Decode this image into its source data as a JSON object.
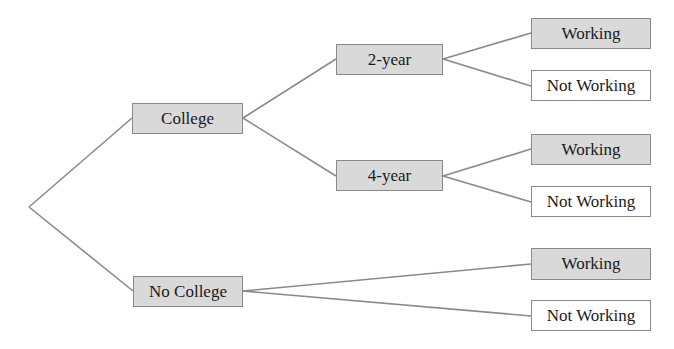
{
  "diagram": {
    "type": "tree",
    "colors": {
      "shaded_fill": "#d9d9d9",
      "plain_fill": "#ffffff",
      "edge": "#8a8a8a",
      "border": "#8a8a8a"
    },
    "root": {
      "x": 29,
      "y": 207
    },
    "level1": [
      {
        "label": "College",
        "fill": "shaded"
      },
      {
        "label": "No College",
        "fill": "shaded"
      }
    ],
    "level2": [
      {
        "label": "2-year",
        "parent": "College",
        "fill": "shaded"
      },
      {
        "label": "4-year",
        "parent": "College",
        "fill": "shaded"
      }
    ],
    "leaves": [
      {
        "label": "Working",
        "parent": "2-year",
        "fill": "shaded"
      },
      {
        "label": "Not Working",
        "parent": "2-year",
        "fill": "plain"
      },
      {
        "label": "Working",
        "parent": "4-year",
        "fill": "shaded"
      },
      {
        "label": "Not Working",
        "parent": "4-year",
        "fill": "plain"
      },
      {
        "label": "Working",
        "parent": "No College",
        "fill": "shaded"
      },
      {
        "label": "Not Working",
        "parent": "No College",
        "fill": "plain"
      }
    ]
  }
}
